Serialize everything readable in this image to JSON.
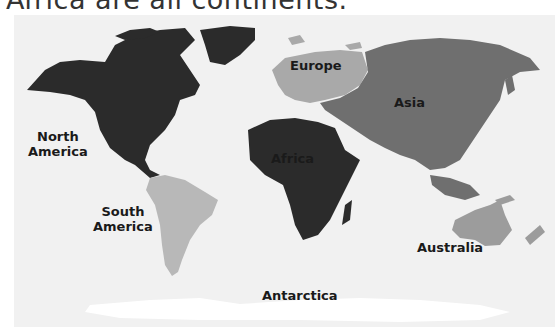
{
  "header": {
    "text": "Africa are all continents."
  },
  "map": {
    "title": "World continents",
    "background_color": "#f1f1f1",
    "continents": [
      {
        "id": "north-america",
        "label_line1": "North",
        "label_line2": "America",
        "color": "#2b2b2b"
      },
      {
        "id": "south-america",
        "label_line1": "South",
        "label_line2": "America",
        "color": "#b8b8b8"
      },
      {
        "id": "europe",
        "label": "Europe",
        "color": "#a9a9a9"
      },
      {
        "id": "asia",
        "label": "Asia",
        "color": "#6f6f6f"
      },
      {
        "id": "africa",
        "label": "Africa",
        "color": "#2b2b2b"
      },
      {
        "id": "australia",
        "label": "Australia",
        "color": "#9c9c9c"
      },
      {
        "id": "antarctica",
        "label": "Antarctica",
        "color": "#ffffff"
      }
    ]
  }
}
